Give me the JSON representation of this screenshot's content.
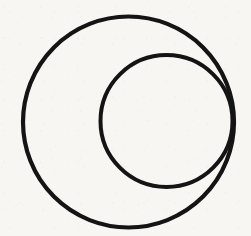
{
  "figure": {
    "canvas": {
      "width": 251,
      "height": 236
    },
    "background_color": "#f7f6f3",
    "ink_color": "#141414",
    "shapes": [
      {
        "name": "outer-circle",
        "type": "circle",
        "cx": 128.5,
        "cy": 122.0,
        "r": 105.5,
        "stroke": "#141414",
        "stroke_width": 4.2,
        "fill": "none"
      },
      {
        "name": "inner-circle",
        "type": "circle",
        "cx": 166.5,
        "cy": 121.0,
        "r": 66.0,
        "stroke": "#141414",
        "stroke_width": 4.0,
        "fill": "none"
      }
    ],
    "tangency_point": {
      "x": 233.5,
      "y": 122.0
    },
    "labels": []
  },
  "chart_data": {
    "type": "scatter",
    "xlabel": "",
    "ylabel": "",
    "xlim": [
      0,
      251
    ],
    "ylim": [
      236,
      0
    ],
    "grid": false,
    "legend": "none",
    "series": [
      {
        "name": "outer-circle",
        "shape": "circle",
        "center": [
          128.5,
          122.0
        ],
        "radius": 105.5,
        "bbox": [
          23.0,
          16.5,
          234.0,
          227.5
        ]
      },
      {
        "name": "inner-circle",
        "shape": "circle",
        "center": [
          166.5,
          121.0
        ],
        "radius": 66.0,
        "bbox": [
          100.5,
          55.0,
          232.5,
          187.0
        ]
      }
    ],
    "annotations": [
      {
        "text": "internal tangency",
        "x": 233.5,
        "y": 122.0
      }
    ]
  }
}
